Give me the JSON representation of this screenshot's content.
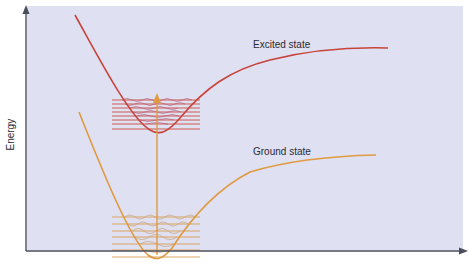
{
  "diagram": {
    "type": "potential-energy-diagram",
    "y_axis_label": "Energy",
    "x_axis_label": "",
    "colors": {
      "background": "#dfe0f2",
      "axes": "#4a4e5c",
      "excited_curve": "#c8443a",
      "ground_curve": "#e09a40",
      "transition_arrow": "#e09a40",
      "excited_levels": "#cf5d4e",
      "ground_levels": "#dca362",
      "text": "#2a2a33"
    },
    "curves": [
      {
        "name": "Excited state",
        "label": "Excited state",
        "color": "#c8443a"
      },
      {
        "name": "Ground state",
        "label": "Ground state",
        "color": "#e09a40"
      }
    ],
    "vibrational_levels": {
      "excited_state_count": 8,
      "ground_state_count": 7
    },
    "transition": {
      "direction": "up",
      "from": "Ground state",
      "to": "Excited state"
    }
  }
}
